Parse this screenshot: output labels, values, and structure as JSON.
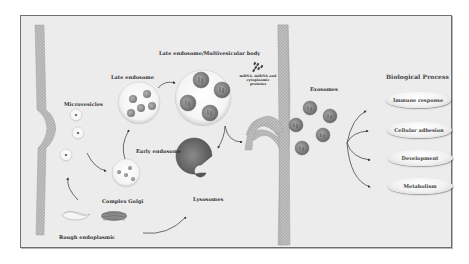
{
  "diagram": {
    "type": "exosome-biogenesis-pathway",
    "labels": {
      "microvesicles": "Microvesicles",
      "late_endosome": "Late endosome",
      "late_endosome_mvb": "Late endosome/Multivesicular body",
      "cargo": "mRNA, miRNA and cytoplasmic proteins",
      "early_endosome": "Early endosome",
      "complex_golgi": "Complex Golgi",
      "rough_er": "Rough endoplasmic",
      "lysosomes": "Lysosomes",
      "exosomes": "Exosomes",
      "biological_process": "Biological Process"
    },
    "processes": [
      {
        "label": "Immune response"
      },
      {
        "label": "Cellular adhesion"
      },
      {
        "label": "Development"
      },
      {
        "label": "Metabolism"
      }
    ],
    "colors": {
      "background": "#ececec",
      "frame_border": "#6f6f6f",
      "membrane": "#9a9a9a",
      "vesicle_fill": "#f7f7f7",
      "exosome": "#8a8a8a",
      "lysosome": "#6e6e6e",
      "arrow": "#333333"
    }
  }
}
